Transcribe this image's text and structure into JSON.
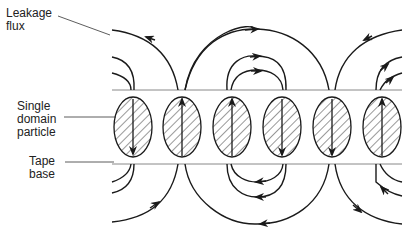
{
  "labels": {
    "leakage_flux": [
      "Leakage",
      "flux"
    ],
    "single_domain_particle": [
      "Single",
      "domain",
      "particle"
    ],
    "tape_base": [
      "Tape",
      "base"
    ]
  },
  "colors": {
    "line": "#1a1a1a",
    "layer_line": "#888888",
    "background": "#ffffff"
  },
  "particles": [
    {
      "index": 1,
      "magnetization": "down"
    },
    {
      "index": 2,
      "magnetization": "up"
    },
    {
      "index": 3,
      "magnetization": "up"
    },
    {
      "index": 4,
      "magnetization": "down"
    },
    {
      "index": 5,
      "magnetization": "down"
    },
    {
      "index": 6,
      "magnetization": "up"
    }
  ]
}
